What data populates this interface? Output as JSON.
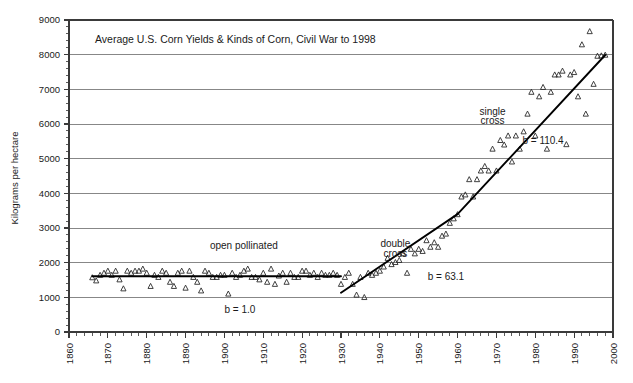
{
  "chart_data": {
    "type": "scatter",
    "title": "Average U.S. Corn Yields & Kinds of Corn, Civil War to 1998",
    "xlabel": "",
    "ylabel": "Kilograms per hectare",
    "xlim": [
      1860,
      2000
    ],
    "ylim": [
      0,
      9000
    ],
    "grid": true,
    "legend": "none",
    "x_ticks": [
      1860,
      1870,
      1880,
      1890,
      1900,
      1910,
      1920,
      1930,
      1940,
      1950,
      1960,
      1970,
      1980,
      1990,
      2000
    ],
    "x_tick_labels": [
      "1860",
      "1870",
      "1880",
      "1890",
      "1900",
      "1910",
      "1920",
      "1930",
      "1940",
      "1950",
      "1960",
      "1970",
      "1980",
      "1990",
      "2000"
    ],
    "x_minor_step": 2,
    "y_ticks": [
      0,
      1000,
      2000,
      3000,
      4000,
      5000,
      6000,
      7000,
      8000,
      9000
    ],
    "y_tick_labels": [
      "0",
      "1000",
      "2000",
      "3000",
      "4000",
      "5000",
      "6000",
      "7000",
      "8000",
      "9000"
    ],
    "y_minor_step": 200,
    "marker": "open-triangle",
    "series": [
      {
        "name": "Average U.S. corn yield",
        "x": [
          1866,
          1867,
          1868,
          1869,
          1870,
          1871,
          1872,
          1873,
          1874,
          1875,
          1876,
          1877,
          1878,
          1879,
          1880,
          1881,
          1882,
          1883,
          1884,
          1885,
          1886,
          1887,
          1888,
          1889,
          1890,
          1891,
          1892,
          1893,
          1894,
          1895,
          1896,
          1897,
          1898,
          1899,
          1900,
          1901,
          1902,
          1903,
          1904,
          1905,
          1906,
          1907,
          1908,
          1909,
          1910,
          1911,
          1912,
          1913,
          1914,
          1915,
          1916,
          1917,
          1918,
          1919,
          1920,
          1921,
          1922,
          1923,
          1924,
          1925,
          1926,
          1927,
          1928,
          1929,
          1930,
          1931,
          1932,
          1933,
          1934,
          1935,
          1936,
          1937,
          1938,
          1939,
          1940,
          1941,
          1942,
          1943,
          1944,
          1945,
          1946,
          1947,
          1948,
          1949,
          1950,
          1951,
          1952,
          1953,
          1954,
          1955,
          1956,
          1957,
          1958,
          1959,
          1960,
          1961,
          1962,
          1963,
          1964,
          1965,
          1966,
          1967,
          1968,
          1969,
          1970,
          1971,
          1972,
          1973,
          1974,
          1975,
          1976,
          1977,
          1978,
          1979,
          1980,
          1981,
          1982,
          1983,
          1984,
          1985,
          1986,
          1987,
          1988,
          1989,
          1990,
          1991,
          1992,
          1993,
          1994,
          1995,
          1996,
          1997,
          1998
        ],
        "y": [
          1570,
          1480,
          1640,
          1700,
          1760,
          1640,
          1760,
          1510,
          1250,
          1760,
          1700,
          1760,
          1760,
          1820,
          1700,
          1320,
          1640,
          1580,
          1760,
          1700,
          1440,
          1320,
          1700,
          1760,
          1270,
          1760,
          1580,
          1440,
          1190,
          1760,
          1700,
          1580,
          1580,
          1640,
          1640,
          1100,
          1700,
          1580,
          1640,
          1760,
          1820,
          1580,
          1580,
          1510,
          1700,
          1440,
          1820,
          1380,
          1620,
          1700,
          1440,
          1700,
          1580,
          1580,
          1760,
          1760,
          1640,
          1700,
          1580,
          1700,
          1640,
          1640,
          1700,
          1640,
          1380,
          1580,
          1700,
          1380,
          1070,
          1580,
          1000,
          1700,
          1640,
          1700,
          1760,
          1880,
          2130,
          1950,
          2010,
          2070,
          2260,
          1700,
          2390,
          2260,
          2390,
          2330,
          2640,
          2450,
          2580,
          2450,
          2770,
          2830,
          3140,
          3270,
          3390,
          3900,
          3960,
          4400,
          3900,
          4400,
          4650,
          4780,
          4650,
          5280,
          4650,
          5530,
          5400,
          5660,
          4910,
          5660,
          5280,
          5780,
          6290,
          6920,
          5660,
          6790,
          7060,
          5280,
          6920,
          7420,
          7420,
          7530,
          5410,
          7420,
          7490,
          6790,
          8290,
          6290,
          8670,
          7150,
          7960,
          7970,
          7990
        ]
      }
    ],
    "trend_segments": [
      {
        "name": "open pollinated",
        "label": "open pollinated",
        "slope_label": "b = 1.0",
        "x_start": 1866,
        "x_end": 1930,
        "y_start": 1610,
        "y_end": 1610
      },
      {
        "name": "double cross",
        "label": "double cross",
        "label_line2": "cross",
        "slope_label": "b = 63.1",
        "x_start": 1930,
        "x_end": 1960,
        "y_start": 1130,
        "y_end": 3400
      },
      {
        "name": "single cross",
        "label": "single cross",
        "slope_label": "b = 110.4",
        "x_start": 1960,
        "x_end": 1998,
        "y_start": 3400,
        "y_end": 7990
      }
    ],
    "annotations": [
      {
        "id": "open-pollinated-label",
        "text": "open pollinated",
        "x": 1905,
        "y": 2400
      },
      {
        "id": "open-pollinated-slope",
        "text": "b = 1.0",
        "x": 1904,
        "y": 560
      },
      {
        "id": "double-cross-label-line1",
        "text": "double",
        "x": 1944,
        "y": 2440
      },
      {
        "id": "double-cross-label-line2",
        "text": "cross",
        "x": 1944,
        "y": 2170
      },
      {
        "id": "double-cross-slope",
        "text": "b = 63.1",
        "x": 1957,
        "y": 1500
      },
      {
        "id": "single-cross-label-line1",
        "text": "single",
        "x": 1969,
        "y": 6260
      },
      {
        "id": "single-cross-label-line2",
        "text": "cross",
        "x": 1969,
        "y": 5990
      },
      {
        "id": "single-cross-slope",
        "text": "b = 110.4",
        "x": 1982,
        "y": 5430
      }
    ],
    "colors": {
      "marker_stroke": "#2b2b2b",
      "trend_line": "#000000",
      "grid": "#7a7a7a",
      "axis": "#3a3a3a",
      "text": "#1a1a1a",
      "background": "#ffffff"
    }
  }
}
